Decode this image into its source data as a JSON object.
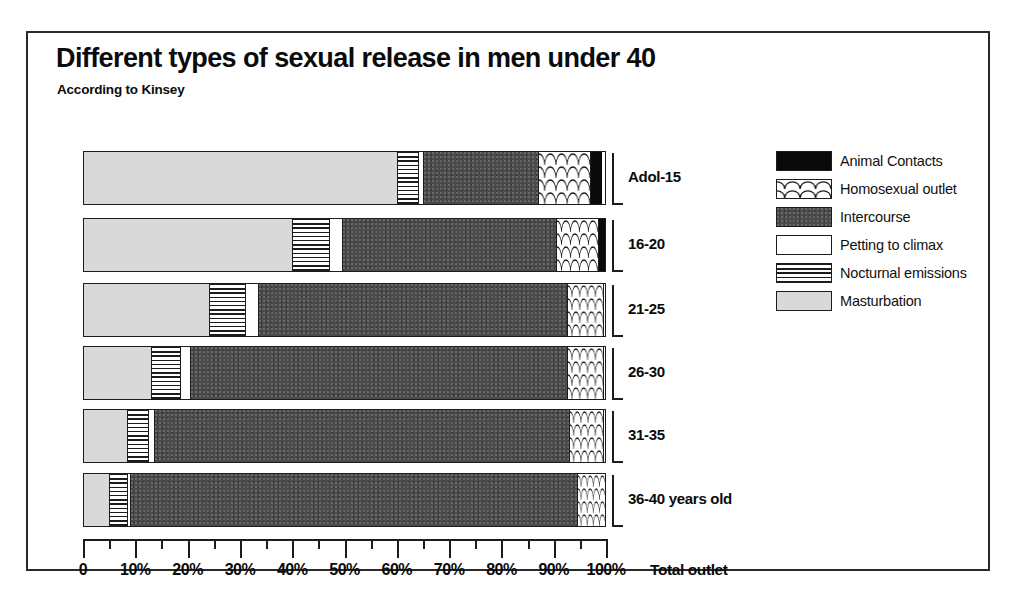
{
  "chart_data": {
    "type": "bar",
    "subtype": "stacked-horizontal-100",
    "title": "Different types of sexual release in men under 40",
    "subtitle": "According to Kinsey",
    "xlabel": "Total outlet",
    "ylabel": "",
    "xlim": [
      0,
      100
    ],
    "xticks": [
      0,
      10,
      20,
      30,
      40,
      50,
      60,
      70,
      80,
      90,
      100
    ],
    "xtick_labels": [
      "0",
      "10%",
      "20%",
      "30%",
      "40%",
      "50%",
      "60%",
      "70%",
      "80%",
      "90%",
      "100%"
    ],
    "minor_tick_step": 5,
    "grid": false,
    "legend_position": "right",
    "categories": [
      "Adol-15",
      "16-20",
      "21-25",
      "26-30",
      "31-35",
      "36-40 years old"
    ],
    "series": [
      {
        "name": "Masturbation",
        "values": [
          60.0,
          40.0,
          24.0,
          13.0,
          8.5,
          5.0
        ]
      },
      {
        "name": "Nocturnal emissions",
        "values": [
          4.0,
          7.0,
          7.0,
          5.5,
          4.0,
          3.5
        ]
      },
      {
        "name": "Petting to climax",
        "values": [
          1.0,
          2.5,
          2.5,
          2.0,
          1.0,
          0.5
        ]
      },
      {
        "name": "Intercourse",
        "values": [
          22.0,
          41.0,
          59.0,
          72.0,
          79.5,
          85.5
        ]
      },
      {
        "name": "Homosexual outlet",
        "values": [
          10.0,
          8.0,
          7.0,
          7.0,
          6.5,
          5.5
        ]
      },
      {
        "name": "Animal Contacts",
        "values": [
          2.0,
          1.5,
          0.0,
          0.0,
          0.0,
          0.0
        ]
      }
    ],
    "legend": [
      {
        "label": "Animal Contacts",
        "pattern": "solid-black",
        "color": "#0a0a0a"
      },
      {
        "label": "Homosexual outlet",
        "pattern": "scales",
        "color": "#ffffff"
      },
      {
        "label": "Intercourse",
        "pattern": "dark-stipple",
        "color": "#4a4a4a"
      },
      {
        "label": "Petting to climax",
        "pattern": "plain-white",
        "color": "#ffffff"
      },
      {
        "label": "Nocturnal emissions",
        "pattern": "horiz-lines",
        "color": "#ffffff"
      },
      {
        "label": "Masturbation",
        "pattern": "light-stipple",
        "color": "#d9d9d9"
      }
    ]
  }
}
